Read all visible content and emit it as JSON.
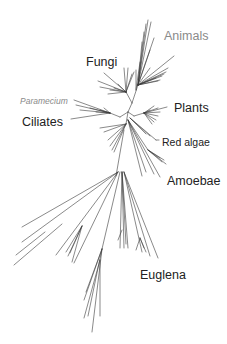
{
  "diagram": {
    "type": "unrooted phylogenetic tree",
    "line_color": "#3a3a3a",
    "labels": [
      {
        "id": "animals",
        "text": "Animals",
        "color": "#8a8a8a"
      },
      {
        "id": "fungi",
        "text": "Fungi",
        "color": "#222222"
      },
      {
        "id": "paramecium",
        "text": "Paramecium",
        "color": "#8a8a8a",
        "style": "italic"
      },
      {
        "id": "ciliates",
        "text": "Ciliates",
        "color": "#222222"
      },
      {
        "id": "plants",
        "text": "Plants",
        "color": "#222222"
      },
      {
        "id": "red_algae",
        "text": "Red algae",
        "color": "#222222"
      },
      {
        "id": "amoebae",
        "text": "Amoebae",
        "color": "#222222"
      },
      {
        "id": "euglena",
        "text": "Euglena",
        "color": "#222222"
      }
    ]
  }
}
